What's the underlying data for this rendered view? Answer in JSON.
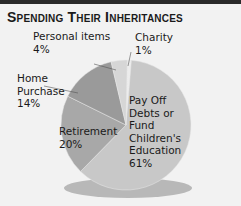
{
  "chart_data": {
    "type": "pie",
    "title": "Spending Their Inheritances",
    "categories": [
      "Pay Off Debts or Fund Children's Education",
      "Retirement",
      "Home Purchase",
      "Personal items",
      "Charity"
    ],
    "values": [
      61,
      20,
      14,
      4,
      1
    ],
    "unit": "%",
    "colors": [
      "#c8c8c8",
      "#a8a8a8",
      "#9a9a9a",
      "#d6d6d6",
      "#ececec"
    ],
    "labels": [
      {
        "line1": "Pay Off",
        "line2": "Debts or",
        "line3": "Fund",
        "line4": "Children's",
        "line5": "Education",
        "pct": "61%"
      },
      {
        "line1": "Retirement",
        "pct": "20%"
      },
      {
        "line1": "Home",
        "line2": "Purchase",
        "pct": "14%"
      },
      {
        "line1": "Personal items",
        "pct": "4%"
      },
      {
        "line1": "Charity",
        "pct": "1%"
      }
    ]
  }
}
